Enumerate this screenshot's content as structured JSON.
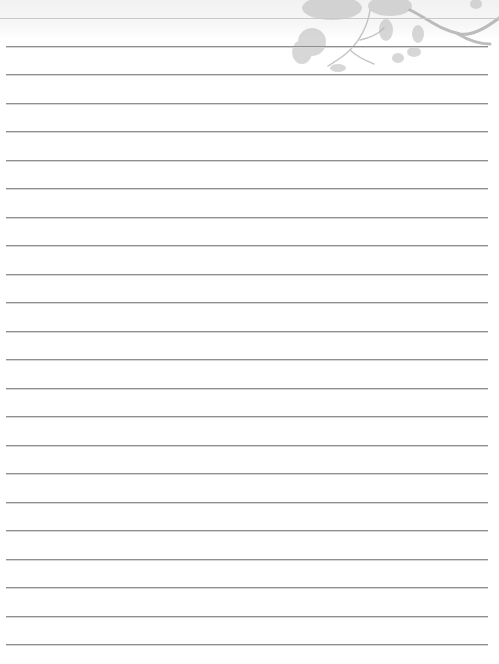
{
  "page": {
    "type": "lined-notepaper",
    "background_color": "#ffffff",
    "rule_color": "#8f8f8f",
    "decoration": "plum-blossom-branch-icon",
    "rules": {
      "top_faint_y": 18,
      "first_y": 46,
      "spacing": 28.48,
      "count": 22,
      "left": 6,
      "right": 488
    }
  }
}
